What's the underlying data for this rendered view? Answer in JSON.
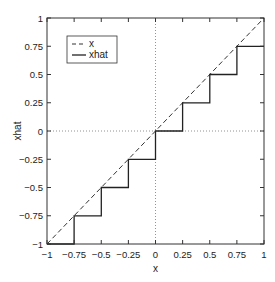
{
  "chart_data": {
    "type": "line",
    "title": "",
    "xlabel": "x",
    "ylabel": "xhat",
    "xlim": [
      -1,
      1
    ],
    "ylim": [
      -1,
      1
    ],
    "xticks": [
      -1,
      -0.75,
      -0.5,
      -0.25,
      0,
      0.25,
      0.5,
      0.75,
      1
    ],
    "yticks": [
      -1,
      -0.75,
      -0.5,
      -0.25,
      0,
      0.25,
      0.5,
      0.75,
      1
    ],
    "xtick_labels": [
      "−1",
      "−0.75",
      "−0.5",
      "−0.25",
      "0",
      "0.25",
      "0.5",
      "0.75",
      "1"
    ],
    "ytick_labels": [
      "−1",
      "−0.75",
      "−0.5",
      "−0.25",
      "0",
      "0.25",
      "0.5",
      "0.75",
      "1"
    ],
    "reference_lines": [
      {
        "orientation": "vertical",
        "value": 0,
        "style": "dotted"
      },
      {
        "orientation": "horizontal",
        "value": 0,
        "style": "dotted"
      }
    ],
    "legend": {
      "position": "top-left",
      "entries": [
        "x",
        "xhat"
      ]
    },
    "series": [
      {
        "name": "x",
        "style": "dashed",
        "color": "#333333",
        "x": [
          -1,
          1
        ],
        "y": [
          -1,
          1
        ]
      },
      {
        "name": "xhat",
        "style": "solid",
        "color": "#222222",
        "x": [
          -1,
          -0.75,
          -0.75,
          -0.5,
          -0.5,
          -0.25,
          -0.25,
          0,
          0,
          0.25,
          0.25,
          0.5,
          0.5,
          0.75,
          0.75,
          1
        ],
        "y": [
          -1,
          -1,
          -0.75,
          -0.75,
          -0.5,
          -0.5,
          -0.25,
          -0.25,
          0,
          0,
          0.25,
          0.25,
          0.5,
          0.5,
          0.75,
          0.75
        ]
      }
    ]
  }
}
